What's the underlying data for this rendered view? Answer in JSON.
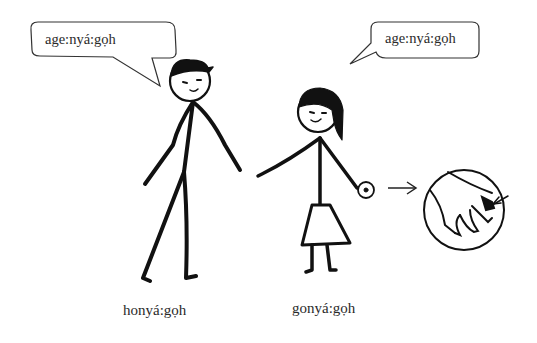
{
  "illustration": {
    "speech_bubbles": [
      {
        "speaker": "man",
        "text": "age:nyá:gọh"
      },
      {
        "speaker": "woman",
        "text": "age:nyá:gọh"
      }
    ],
    "captions": {
      "man": "honyá:gọh",
      "woman": "gonyá:gọh"
    },
    "figures": [
      {
        "name": "man",
        "icon": "stick-figure-man"
      },
      {
        "name": "woman",
        "icon": "stick-figure-woman"
      }
    ],
    "detail": {
      "icon": "magnified-hand",
      "pointer": "arrow-right"
    },
    "colors": {
      "ink": "#111111",
      "background": "#ffffff"
    }
  }
}
